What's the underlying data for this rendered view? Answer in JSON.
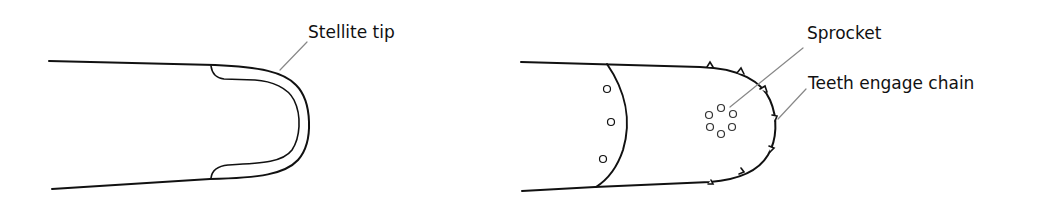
{
  "diagrams": [
    {
      "name": "stellite-tip-bar",
      "labels": [
        {
          "id": "stellite",
          "text": "Stellite tip"
        }
      ]
    },
    {
      "name": "sprocket-nose-bar",
      "labels": [
        {
          "id": "sprocket",
          "text": "Sprocket"
        },
        {
          "id": "teeth",
          "text": "Teeth engage chain"
        }
      ]
    }
  ],
  "colors": {
    "line": "#111111",
    "leader": "#888888",
    "background": "#ffffff"
  }
}
